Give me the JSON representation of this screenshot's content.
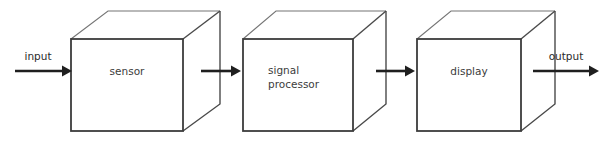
{
  "diagram": {
    "type": "block-diagram",
    "background_color": "#ffffff",
    "stroke_color": "#3c3c3c",
    "text_color": "#3c3c3c",
    "blocks": [
      {
        "id": "sensor",
        "label": "sensor",
        "label_lines": [
          "sensor"
        ],
        "shape": "cube"
      },
      {
        "id": "signal-processor",
        "label": "signal processor",
        "label_lines": [
          "signal",
          "processor"
        ],
        "shape": "cube"
      },
      {
        "id": "display",
        "label": "display",
        "label_lines": [
          "display"
        ],
        "shape": "cube"
      }
    ],
    "flows": [
      {
        "id": "input",
        "label": "input",
        "direction": "right"
      },
      {
        "id": "sensor-to-processor",
        "label": "",
        "direction": "right"
      },
      {
        "id": "processor-to-display",
        "label": "",
        "direction": "right"
      },
      {
        "id": "output",
        "label": "output",
        "direction": "right"
      }
    ]
  }
}
